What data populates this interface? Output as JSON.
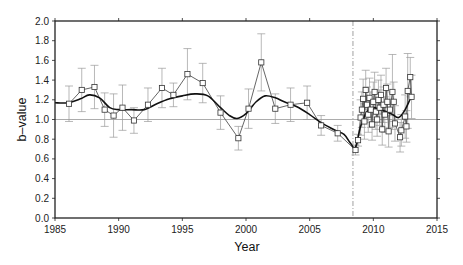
{
  "chart_data": {
    "type": "line",
    "title": "",
    "xlabel": "Year",
    "ylabel": "b–value",
    "xlim": [
      1985,
      2015
    ],
    "ylim": [
      0.0,
      2.0
    ],
    "xticks": [
      1985,
      1990,
      1995,
      2000,
      2005,
      2010,
      2015
    ],
    "yticks": [
      0.0,
      0.2,
      0.4,
      0.6,
      0.8,
      1.0,
      1.2,
      1.4,
      1.6,
      1.8,
      2.0
    ],
    "xtick_labels": [
      "1985",
      "1990",
      "1995",
      "2000",
      "2005",
      "2010",
      "2015"
    ],
    "ytick_labels": [
      "0.0",
      "0.2",
      "0.4",
      "0.6",
      "0.8",
      "1.0",
      "1.2",
      "1.4",
      "1.6",
      "1.8",
      "2.0"
    ],
    "grid": false,
    "legend": null,
    "reference_lines": {
      "horizontal_y": 1.0,
      "vertical_dashed_x": 2008.4
    },
    "series": [
      {
        "name": "b-value estimates",
        "style": "thin line with square markers and error bars",
        "x": [
          1986.1,
          1987.1,
          1988.1,
          1988.9,
          1989.6,
          1990.3,
          1991.2,
          1992.3,
          1993.4,
          1994.3,
          1995.4,
          1996.6,
          1998.0,
          1999.4,
          2000.2,
          2001.2,
          2002.3,
          2003.5,
          2004.8,
          2005.9,
          2007.2,
          2008.6,
          2008.8,
          2009.0,
          2009.1,
          2009.2,
          2009.3,
          2009.4,
          2009.5,
          2009.6,
          2009.7,
          2009.8,
          2009.9,
          2010.0,
          2010.1,
          2010.2,
          2010.3,
          2010.4,
          2010.5,
          2010.6,
          2010.7,
          2010.8,
          2010.9,
          2011.0,
          2011.1,
          2011.2,
          2011.3,
          2011.5,
          2011.6,
          2011.7,
          2012.1,
          2012.2,
          2012.5,
          2012.6,
          2012.7,
          2012.9,
          2013.0
        ],
        "values": [
          1.16,
          1.3,
          1.33,
          1.1,
          1.04,
          1.12,
          0.99,
          1.15,
          1.32,
          1.25,
          1.46,
          1.37,
          1.07,
          0.81,
          1.11,
          1.58,
          1.11,
          1.15,
          1.17,
          0.94,
          0.86,
          0.69,
          0.79,
          1.02,
          1.1,
          1.21,
          0.98,
          1.3,
          1.15,
          1.05,
          1.22,
          1.1,
          0.95,
          1.18,
          1.28,
          1.08,
          1.0,
          1.2,
          1.12,
          1.25,
          0.9,
          1.15,
          1.05,
          1.32,
          1.18,
          0.88,
          1.1,
          1.28,
          1.18,
          0.96,
          0.82,
          0.89,
          1.03,
          0.93,
          1.29,
          1.43,
          1.23
        ],
        "errors": [
          0.18,
          0.22,
          0.22,
          0.17,
          0.22,
          0.23,
          0.13,
          0.17,
          0.2,
          0.12,
          0.26,
          0.2,
          0.17,
          0.12,
          0.2,
          0.29,
          0.15,
          0.17,
          0.17,
          0.1,
          0.08,
          0.05,
          0.06,
          0.18,
          0.18,
          0.2,
          0.18,
          0.2,
          0.18,
          0.18,
          0.2,
          0.18,
          0.16,
          0.2,
          0.2,
          0.18,
          0.17,
          0.2,
          0.18,
          0.2,
          0.16,
          0.18,
          0.18,
          0.2,
          0.18,
          0.16,
          0.18,
          0.38,
          0.2,
          0.18,
          0.15,
          0.16,
          0.22,
          0.16,
          0.38,
          0.2,
          0.22
        ]
      },
      {
        "name": "smoothed trend",
        "style": "thick smooth line",
        "x": [
          1985.0,
          1986.0,
          1987.0,
          1987.7,
          1988.5,
          1989.3,
          1990.0,
          1991.0,
          1992.0,
          1993.0,
          1994.0,
          1995.0,
          1996.0,
          1997.0,
          1998.0,
          1998.7,
          1999.3,
          2000.0,
          2000.8,
          2001.5,
          2002.3,
          2003.0,
          2004.0,
          2005.0,
          2006.0,
          2007.0,
          2007.7,
          2008.2,
          2008.6,
          2009.0,
          2009.5,
          2010.0,
          2010.5,
          2011.0,
          2011.5,
          2012.0,
          2012.5,
          2013.0
        ],
        "values": [
          1.17,
          1.17,
          1.21,
          1.25,
          1.22,
          1.12,
          1.1,
          1.1,
          1.1,
          1.16,
          1.21,
          1.24,
          1.26,
          1.24,
          1.12,
          1.04,
          1.01,
          1.06,
          1.18,
          1.24,
          1.22,
          1.18,
          1.13,
          1.05,
          0.96,
          0.89,
          0.85,
          0.76,
          0.72,
          0.93,
          1.08,
          1.12,
          1.1,
          1.08,
          1.05,
          1.02,
          1.1,
          1.24
        ]
      }
    ]
  },
  "colors": {
    "axis": "#222222",
    "series_thin": "#555555",
    "series_thick": "#111111",
    "error_bars": "#9a9a9a",
    "reference": "#888888"
  }
}
